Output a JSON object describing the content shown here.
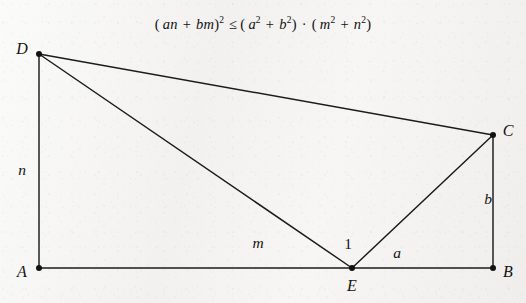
{
  "formula": {
    "text": "(an + bm)^2 ≤ (a^2 + b^2) · (m^2 + n^2)",
    "lparen": "(",
    "a": "a",
    "n": "n",
    "plus": "+",
    "b": "b",
    "m": "m",
    "rparen": ")",
    "exp2": "2",
    "leq": "≤",
    "cdot": "·"
  },
  "diagram": {
    "type": "geometry-figure",
    "vertices": [
      {
        "name": "D",
        "label": "D",
        "x": 39,
        "y": 54,
        "label_x": 22,
        "label_y": 49
      },
      {
        "name": "C",
        "label": "C",
        "x": 493,
        "y": 135,
        "label_x": 508,
        "label_y": 131
      },
      {
        "name": "A",
        "label": "A",
        "x": 39,
        "y": 268,
        "label_x": 22,
        "label_y": 272
      },
      {
        "name": "B",
        "label": "B",
        "x": 493,
        "y": 268,
        "label_x": 508,
        "label_y": 272
      },
      {
        "name": "E",
        "label": "E",
        "x": 352,
        "y": 268,
        "label_x": 352,
        "label_y": 286
      }
    ],
    "edges": [
      {
        "name": "edge-A-D",
        "from": "A",
        "to": "D"
      },
      {
        "name": "edge-A-B",
        "from": "A",
        "to": "B"
      },
      {
        "name": "edge-D-C",
        "from": "D",
        "to": "C"
      },
      {
        "name": "edge-C-B",
        "from": "C",
        "to": "B"
      },
      {
        "name": "edge-D-E",
        "from": "D",
        "to": "E"
      },
      {
        "name": "edge-E-C",
        "from": "E",
        "to": "C"
      }
    ],
    "side_labels": [
      {
        "name": "label-n",
        "text": "n",
        "x": 22,
        "y": 170,
        "italic": true
      },
      {
        "name": "label-b",
        "text": "b",
        "x": 488,
        "y": 199,
        "italic": true
      },
      {
        "name": "label-m",
        "text": "m",
        "x": 258,
        "y": 243,
        "italic": true
      },
      {
        "name": "label-a",
        "text": "a",
        "x": 397,
        "y": 253,
        "italic": true
      },
      {
        "name": "label-angle-1",
        "text": "1",
        "x": 348,
        "y": 244,
        "italic": false
      }
    ]
  },
  "colors": {
    "ink": "#1b1b1b",
    "paper": "#f4f3f1"
  }
}
